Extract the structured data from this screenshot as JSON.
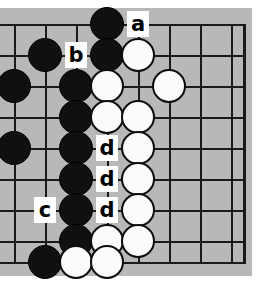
{
  "figure": {
    "kind": "go-board-diagram",
    "width": 265,
    "height": 284,
    "board_background": "#b8b8b8",
    "page_background": "#ffffff",
    "line_color": "#1a1a1a",
    "grid_spacing": 31,
    "grid_x": [
      14,
      45,
      76,
      107,
      138,
      169,
      200,
      231
    ],
    "grid_y": [
      24,
      55,
      86,
      117,
      148,
      179,
      210,
      241,
      262
    ],
    "board_right_edge": 243,
    "cropped_edges": [
      "left",
      "bottom"
    ]
  },
  "stones": {
    "black_color": "#101010",
    "white_color": "#fbfbfb",
    "black": [
      {
        "x": 14,
        "y": 86
      },
      {
        "x": 14,
        "y": 148
      },
      {
        "x": 45,
        "y": 55
      },
      {
        "x": 45,
        "y": 262
      },
      {
        "x": 76,
        "y": 86
      },
      {
        "x": 76,
        "y": 117
      },
      {
        "x": 76,
        "y": 148
      },
      {
        "x": 76,
        "y": 179
      },
      {
        "x": 76,
        "y": 210
      },
      {
        "x": 76,
        "y": 241
      },
      {
        "x": 107,
        "y": 24
      },
      {
        "x": 107,
        "y": 55
      }
    ],
    "white": [
      {
        "x": 107,
        "y": 86
      },
      {
        "x": 107,
        "y": 117
      },
      {
        "x": 107,
        "y": 241
      },
      {
        "x": 76,
        "y": 262
      },
      {
        "x": 107,
        "y": 262
      },
      {
        "x": 138,
        "y": 55
      },
      {
        "x": 138,
        "y": 117
      },
      {
        "x": 138,
        "y": 148
      },
      {
        "x": 138,
        "y": 179
      },
      {
        "x": 138,
        "y": 210
      },
      {
        "x": 138,
        "y": 241
      },
      {
        "x": 169,
        "y": 86
      }
    ]
  },
  "labels": [
    {
      "text": "a",
      "x": 138,
      "y": 24
    },
    {
      "text": "b",
      "x": 76,
      "y": 55
    },
    {
      "text": "c",
      "x": 45,
      "y": 210
    },
    {
      "text": "d",
      "x": 107,
      "y": 148
    },
    {
      "text": "d",
      "x": 107,
      "y": 179
    },
    {
      "text": "d",
      "x": 107,
      "y": 210
    }
  ]
}
